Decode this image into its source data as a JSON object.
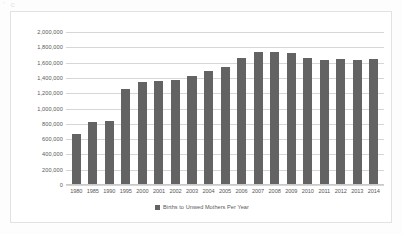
{
  "scan": {
    "artifact_text": "' c"
  },
  "chart_data": {
    "type": "bar",
    "title": "",
    "xlabel": "",
    "ylabel": "",
    "ylim": [
      0,
      2000000
    ],
    "grid": true,
    "legend_position": "bottom",
    "series_color": "#636363",
    "categories": [
      "1980",
      "1985",
      "1990",
      "1995",
      "2000",
      "2001",
      "2002",
      "2003",
      "2004",
      "2005",
      "2006",
      "2007",
      "2008",
      "2009",
      "2010",
      "2011",
      "2012",
      "2013",
      "2014"
    ],
    "values": [
      670000,
      830000,
      835000,
      1255000,
      1350000,
      1355000,
      1375000,
      1430000,
      1485000,
      1545000,
      1660000,
      1740000,
      1740000,
      1720000,
      1655000,
      1640000,
      1645000,
      1635000,
      1645000
    ],
    "series": [
      {
        "name": "Births to Unwed Mothers Per Year",
        "values": [
          670000,
          830000,
          835000,
          1255000,
          1350000,
          1355000,
          1375000,
          1430000,
          1485000,
          1545000,
          1660000,
          1740000,
          1740000,
          1720000,
          1655000,
          1640000,
          1645000,
          1635000,
          1645000
        ]
      }
    ],
    "ytick_labels": [
      "2,000,000",
      "1,800,000",
      "1,600,000",
      "1,400,000",
      "1,200,000",
      "1,000,000",
      "800,000",
      "600,000",
      "400,000",
      "200,000",
      "0"
    ],
    "ytick_values": [
      2000000,
      1800000,
      1600000,
      1400000,
      1200000,
      1000000,
      800000,
      600000,
      400000,
      200000,
      0
    ],
    "legend": [
      "Births to Unwed Mothers Per Year"
    ]
  }
}
